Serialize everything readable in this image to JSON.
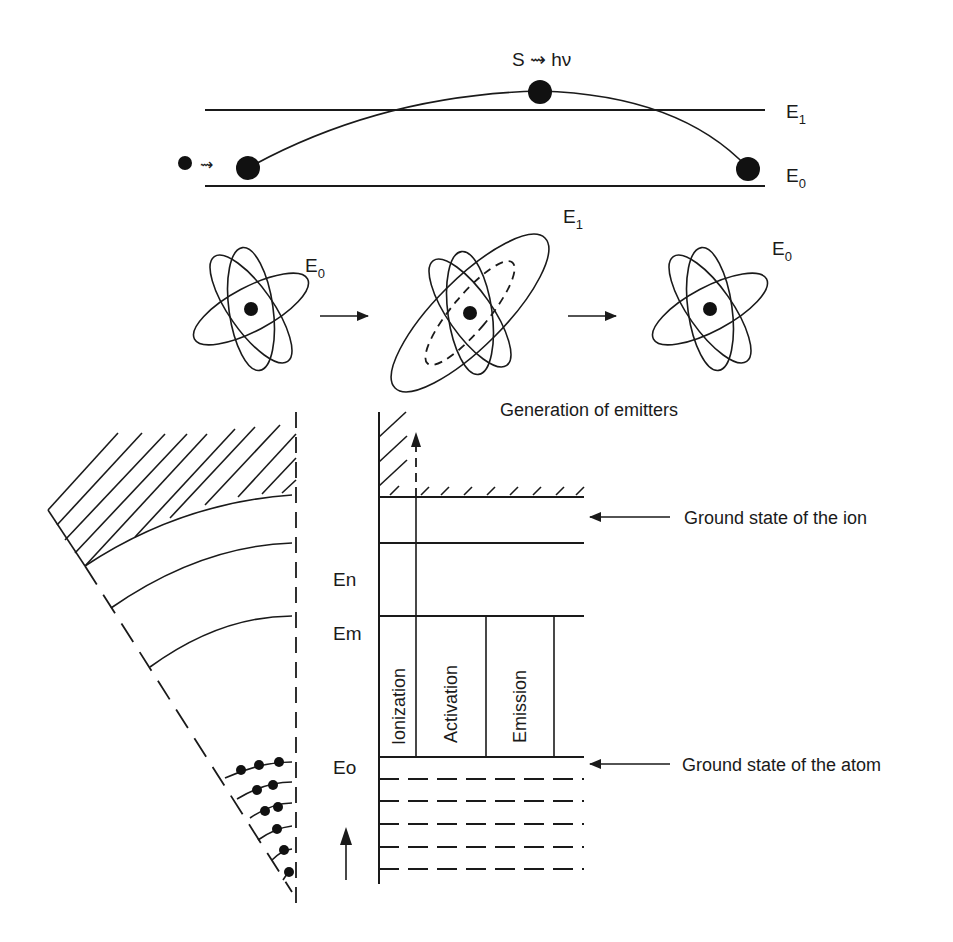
{
  "top_panel": {
    "emission_label": "S ⇝ hν",
    "level_upper": "E",
    "level_upper_sub": "1",
    "level_lower": "E",
    "level_lower_sub": "0",
    "incoming_arrow": "⇝"
  },
  "atoms_panel": {
    "atoms": [
      {
        "label": "E",
        "sub": "0",
        "state": "ground"
      },
      {
        "label": "E",
        "sub": "1",
        "state": "excited"
      },
      {
        "label": "E",
        "sub": "0",
        "state": "ground"
      }
    ],
    "caption": "Generation of emitters"
  },
  "energy_diagram": {
    "levels": [
      {
        "label": "En"
      },
      {
        "label": "Em"
      },
      {
        "label": "Eo"
      }
    ],
    "columns": [
      "Ionization",
      "Activation",
      "Emission"
    ],
    "annotations": [
      {
        "text": "Ground state of the ion"
      },
      {
        "text": "Ground state of the atom"
      }
    ]
  },
  "colors": {
    "ink": "#1a1a1a",
    "background": "#ffffff"
  }
}
